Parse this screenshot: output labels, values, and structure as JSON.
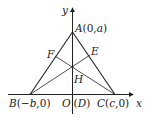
{
  "diagram": {
    "type": "coordinate-geometry",
    "axes": {
      "x_label": "x",
      "y_label": "y"
    },
    "points": {
      "A": {
        "label": "A(0,a)",
        "coords": "(0,a)"
      },
      "B": {
        "label": "B(−b,0)",
        "coords": "(−b,0)"
      },
      "C": {
        "label": "C(c,0)",
        "coords": "(c,0)"
      },
      "O": {
        "label": "O",
        "note": "(D)"
      },
      "E": {
        "label": "E"
      },
      "F": {
        "label": "F"
      },
      "H": {
        "label": "H"
      }
    },
    "labels": {
      "y": "y",
      "x": "x",
      "A_name": "A",
      "A_coords": "(0,",
      "A_var": "a",
      "A_close": ")",
      "B_name": "B",
      "B_open": "(−",
      "B_var": "b",
      "B_close": ",0)",
      "O": "O",
      "D": "(D)",
      "D_open": "(",
      "D_name": "D",
      "D_close": ")",
      "C_name": "C",
      "C_open": "(",
      "C_var": "c",
      "C_close": ",0)",
      "E": "E",
      "F": "F",
      "H": "H"
    },
    "segments": [
      "AB",
      "AC",
      "AD",
      "BE",
      "CF"
    ],
    "colors": {
      "line": "#222222",
      "background": "#ffffff"
    }
  }
}
